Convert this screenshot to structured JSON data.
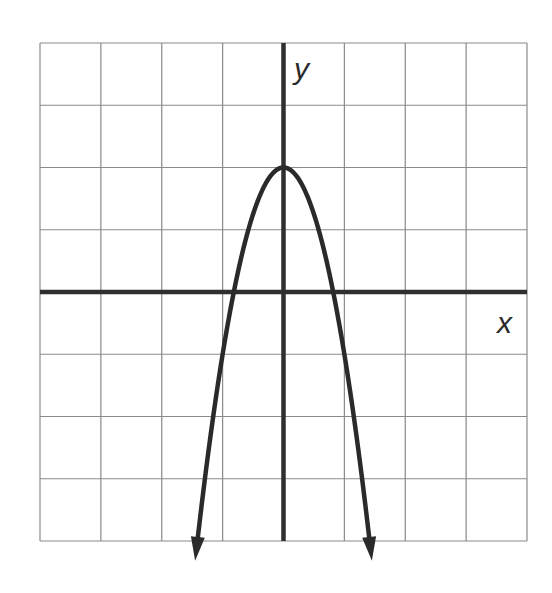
{
  "chart_data": {
    "type": "line",
    "title": "",
    "xlabel": "x",
    "ylabel": "y",
    "xlim": [
      -4,
      4
    ],
    "ylim": [
      -4,
      4
    ],
    "grid": true,
    "grid_step": 1,
    "tick_labels": false,
    "legend": null,
    "series": [
      {
        "name": "parabola",
        "equation": "y = -3x^2 + 2",
        "vertex": [
          0,
          2
        ],
        "x_intercepts": [
          -0.82,
          0.82
        ],
        "end_arrows": "both ends point downward",
        "x": [
          -1.41,
          -1.2,
          -1.0,
          -0.8,
          -0.6,
          -0.4,
          -0.2,
          0,
          0.2,
          0.4,
          0.6,
          0.8,
          1.0,
          1.2,
          1.41
        ],
        "y": [
          -4.0,
          -2.32,
          -1.0,
          0.08,
          0.92,
          1.52,
          1.88,
          2.0,
          1.88,
          1.52,
          0.92,
          0.08,
          -1.0,
          -2.32,
          -4.0
        ]
      }
    ],
    "colors": {
      "curve": "#2a2a2a",
      "axes": "#2f2f2f",
      "grid": "#8a8a8a",
      "background": "#ffffff"
    }
  },
  "labels": {
    "x_axis": "x",
    "y_axis": "y"
  }
}
